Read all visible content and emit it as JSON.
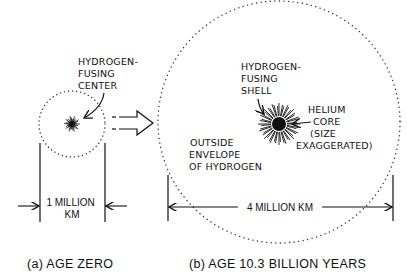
{
  "panel_a": {
    "label_center": [
      "HYDROGEN-",
      "FUSING",
      "CENTER"
    ],
    "dimension": [
      "1 MILLION",
      "KM"
    ],
    "caption": "(a) AGE ZERO"
  },
  "panel_b": {
    "label_shell": [
      "HYDROGEN-",
      "FUSING",
      "SHELL"
    ],
    "label_core": [
      "HELIUM",
      "CORE",
      "(SIZE",
      "EXAGGERATED)"
    ],
    "label_envelope": [
      "OUTSIDE",
      "ENVELOPE",
      "OF HYDROGEN"
    ],
    "dimension": "4 MILLION KM",
    "caption": "(b) AGE 10.3 BILLION YEARS"
  },
  "transition_arrow": "evolves-to"
}
